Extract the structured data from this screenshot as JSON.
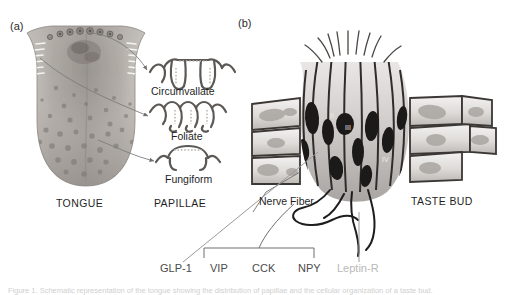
{
  "figure": {
    "panels": [
      {
        "tag": "(a)",
        "name": "tongue-panel"
      },
      {
        "tag": "(b)",
        "name": "taste-bud-panel"
      }
    ],
    "panel_a": {
      "organ_label": "TONGUE",
      "group_label": "PAPILLAE",
      "papillae": [
        {
          "label": "Circumvallate"
        },
        {
          "label": "Foliate"
        },
        {
          "label": "Fungiform"
        }
      ]
    },
    "panel_b": {
      "structure_label": "TASTE BUD",
      "nerve_label": "Nerve Fiber",
      "cell_types": [
        {
          "numeral": "II"
        },
        {
          "numeral": "III"
        },
        {
          "numeral": "IV"
        }
      ]
    },
    "peptides": {
      "standalone_left": "GLP-1",
      "bracketed": [
        "VIP",
        "CCK",
        "NPY"
      ],
      "standalone_right": "Leptin-R"
    },
    "caption": "Figure 1. Schematic representation of the tongue showing the distribution of papillae and the cellular organization of a taste bud."
  },
  "colors": {
    "ink": "#1f1f1f",
    "leader_line": "#7d7d7d",
    "muted_text": "#b9b9b9",
    "peptide_text": "#4a4a4a",
    "tissue_dark": "#3a3a3a",
    "tissue_mid": "#9a9a9a",
    "tissue_light": "#dcdcdc"
  }
}
